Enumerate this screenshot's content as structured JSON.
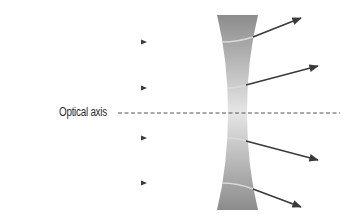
{
  "diagram": {
    "labels": {
      "optical_axis": "Optical axis"
    },
    "lens": {
      "type": "concave",
      "top_y": 15,
      "bottom_y": 210,
      "mid_y": 112,
      "edge_left": 217,
      "edge_right": 258,
      "waist_left": 228,
      "waist_right": 247,
      "color_edge": "#8f8f8f",
      "color_center": "#e4e4e4"
    },
    "optical_axis": {
      "y": 113,
      "x_start": 118,
      "x_end": 340,
      "color": "#555555"
    },
    "rays": [
      {
        "id": 1,
        "incoming_y": 42,
        "x_start": 18,
        "arrow_x": 145,
        "lens_in": [
          222,
          42
        ],
        "lens_out": [
          253,
          37
        ],
        "end": [
          301,
          18
        ]
      },
      {
        "id": 2,
        "incoming_y": 88,
        "x_start": 18,
        "arrow_x": 145,
        "lens_in": [
          228,
          88
        ],
        "lens_out": [
          246,
          85
        ],
        "end": [
          318,
          66
        ]
      },
      {
        "id": 3,
        "incoming_y": 138,
        "x_start": 18,
        "arrow_x": 145,
        "lens_in": [
          228,
          138
        ],
        "lens_out": [
          246,
          141
        ],
        "end": [
          318,
          160
        ]
      },
      {
        "id": 4,
        "incoming_y": 183,
        "x_start": 18,
        "arrow_x": 145,
        "lens_in": [
          222,
          183
        ],
        "lens_out": [
          253,
          189
        ],
        "end": [
          301,
          207
        ]
      }
    ],
    "colors": {
      "ray": "#3a3a3a",
      "ray_inside_lens": "#d8d8d8",
      "background": "#ffffff"
    }
  }
}
